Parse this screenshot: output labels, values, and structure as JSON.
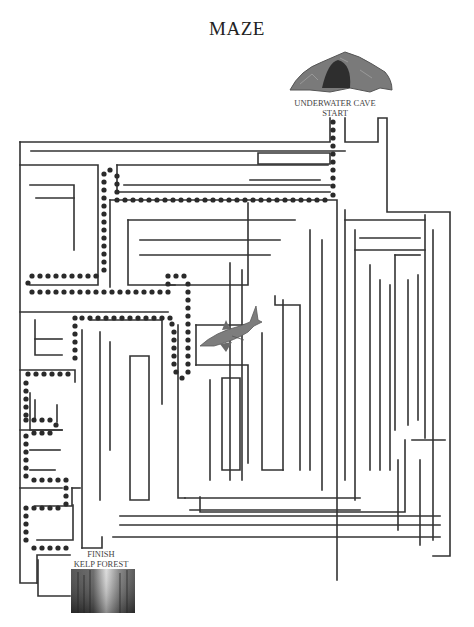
{
  "title": "MAZE",
  "start": {
    "line1": "UNDERWATER CAVE",
    "line2": "START"
  },
  "finish": {
    "line1": "FINISH",
    "line2": "KELP FOREST"
  },
  "colors": {
    "wall": "#333333",
    "dot": "#2a2a2a",
    "shark": "#7a7a7a",
    "cave": "#6b6b6b"
  },
  "walls": [
    "M20 142 H330 V118",
    "M345 118 V142 H378 V118 H387 V212 H450 V556 H433",
    "M20 142 V583 H37",
    "M37 583 V555 H70",
    "M20 165 H98 V285 H30",
    "M30 185 H74 V250",
    "M36 198 H74",
    "M31 151 H345",
    "M117 165 H328",
    "M117 165 V192 H330",
    "M124 185 H330",
    "M258 153 H330 V164 H258 Z",
    "M250 180 H320",
    "M110 200 H337 V580",
    "M110 200 V287",
    "M128 220 H295",
    "M128 220 V285 H175",
    "M140 240 H280",
    "M140 255 H270",
    "M170 285 H248 V203",
    "M20 312 H168",
    "M35 320 V355 H62",
    "M35 339 H62",
    "M20 370 H75 V382",
    "M30 393 V430 H62",
    "M35 400 V420",
    "M57 405 V422",
    "M20 430 H62",
    "M30 450 H60",
    "M30 470 H55",
    "M20 488 H62",
    "M35 506 H72 V488",
    "M72 488 H80",
    "M90 320 H162 V404",
    "M100 332 V500",
    "M110 342 V450",
    "M130 356 H149 V500 H130 Z",
    "M178 325 V498 H185",
    "M196 325 H250",
    "M196 325 V365",
    "M196 365 H248 V463",
    "M210 380 V480",
    "M222 378 H240 V470 H222 Z",
    "M262 333 V470 H283",
    "M283 300 V470",
    "M275 296 V305 H300 V470",
    "M230 263 V480",
    "M242 270 V480",
    "M310 230 V470",
    "M322 240 V490",
    "M345 210 V480",
    "M355 230 V500",
    "M345 220 H425",
    "M355 250 H425",
    "M360 238 H420",
    "M425 215 V438",
    "M412 440 H445",
    "M405 440 V512 H200 V497",
    "M395 255 H420",
    "M395 255 V430",
    "M408 280 V425",
    "M418 275 V420",
    "M433 230 V540",
    "M390 285 V470",
    "M370 265 V470",
    "M380 280 V470",
    "M398 460 V530",
    "M420 460 V545",
    "M185 498 H360",
    "M190 510 H360",
    "M120 516 H440",
    "M120 525 H440",
    "M113 537 H440",
    "M82 330 V548",
    "M82 548 H102 V537",
    "M38 560 V596 H70",
    "M37 540 H73 V505"
  ],
  "solution_dots": [
    [
      333,
      122
    ],
    [
      333,
      130
    ],
    [
      333,
      138
    ],
    [
      333,
      146
    ],
    [
      333,
      154
    ],
    [
      333,
      162
    ],
    [
      333,
      170
    ],
    [
      333,
      178
    ],
    [
      333,
      186
    ],
    [
      333,
      195
    ],
    [
      325,
      200
    ],
    [
      317,
      200
    ],
    [
      309,
      200
    ],
    [
      301,
      200
    ],
    [
      293,
      200
    ],
    [
      285,
      200
    ],
    [
      277,
      200
    ],
    [
      269,
      200
    ],
    [
      261,
      200
    ],
    [
      253,
      200
    ],
    [
      245,
      200
    ],
    [
      237,
      200
    ],
    [
      229,
      200
    ],
    [
      221,
      200
    ],
    [
      213,
      200
    ],
    [
      205,
      200
    ],
    [
      197,
      200
    ],
    [
      189,
      200
    ],
    [
      181,
      200
    ],
    [
      173,
      200
    ],
    [
      165,
      200
    ],
    [
      157,
      200
    ],
    [
      149,
      200
    ],
    [
      141,
      200
    ],
    [
      133,
      200
    ],
    [
      125,
      200
    ],
    [
      117,
      200
    ],
    [
      117,
      192
    ],
    [
      117,
      184
    ],
    [
      117,
      176
    ],
    [
      110,
      170
    ],
    [
      104,
      174
    ],
    [
      104,
      182
    ],
    [
      104,
      190
    ],
    [
      104,
      198
    ],
    [
      104,
      206
    ],
    [
      104,
      214
    ],
    [
      104,
      222
    ],
    [
      104,
      230
    ],
    [
      104,
      238
    ],
    [
      104,
      246
    ],
    [
      104,
      254
    ],
    [
      104,
      262
    ],
    [
      104,
      270
    ],
    [
      96,
      276
    ],
    [
      88,
      276
    ],
    [
      80,
      276
    ],
    [
      72,
      276
    ],
    [
      64,
      276
    ],
    [
      56,
      276
    ],
    [
      48,
      276
    ],
    [
      40,
      276
    ],
    [
      32,
      276
    ],
    [
      28,
      283
    ],
    [
      32,
      292
    ],
    [
      40,
      292
    ],
    [
      48,
      292
    ],
    [
      56,
      292
    ],
    [
      64,
      292
    ],
    [
      72,
      292
    ],
    [
      80,
      292
    ],
    [
      88,
      292
    ],
    [
      96,
      292
    ],
    [
      104,
      292
    ],
    [
      112,
      292
    ],
    [
      120,
      292
    ],
    [
      128,
      292
    ],
    [
      136,
      292
    ],
    [
      144,
      292
    ],
    [
      152,
      292
    ],
    [
      160,
      292
    ],
    [
      168,
      292
    ],
    [
      168,
      284
    ],
    [
      168,
      276
    ],
    [
      176,
      276
    ],
    [
      184,
      276
    ],
    [
      188,
      284
    ],
    [
      188,
      292
    ],
    [
      188,
      300
    ],
    [
      188,
      308
    ],
    [
      188,
      316
    ],
    [
      188,
      324
    ],
    [
      188,
      332
    ],
    [
      188,
      340
    ],
    [
      188,
      348
    ],
    [
      188,
      356
    ],
    [
      188,
      364
    ],
    [
      188,
      372
    ],
    [
      182,
      378
    ],
    [
      176,
      372
    ],
    [
      174,
      364
    ],
    [
      174,
      356
    ],
    [
      174,
      348
    ],
    [
      174,
      340
    ],
    [
      174,
      332
    ],
    [
      172,
      324
    ],
    [
      170,
      318
    ],
    [
      162,
      318
    ],
    [
      154,
      318
    ],
    [
      146,
      318
    ],
    [
      138,
      318
    ],
    [
      130,
      318
    ],
    [
      122,
      318
    ],
    [
      114,
      318
    ],
    [
      106,
      318
    ],
    [
      98,
      318
    ],
    [
      90,
      318
    ],
    [
      82,
      318
    ],
    [
      75,
      318
    ],
    [
      75,
      326
    ],
    [
      75,
      334
    ],
    [
      75,
      342
    ],
    [
      75,
      350
    ],
    [
      75,
      358
    ],
    [
      68,
      374
    ],
    [
      60,
      374
    ],
    [
      52,
      374
    ],
    [
      44,
      374
    ],
    [
      36,
      374
    ],
    [
      28,
      374
    ],
    [
      26,
      383
    ],
    [
      26,
      391
    ],
    [
      26,
      399
    ],
    [
      26,
      407
    ],
    [
      26,
      415
    ],
    [
      26,
      420
    ],
    [
      34,
      420
    ],
    [
      42,
      420
    ],
    [
      50,
      420
    ],
    [
      56,
      425
    ],
    [
      50,
      433
    ],
    [
      42,
      433
    ],
    [
      34,
      433
    ],
    [
      26,
      436
    ],
    [
      26,
      444
    ],
    [
      26,
      452
    ],
    [
      26,
      460
    ],
    [
      26,
      468
    ],
    [
      26,
      476
    ],
    [
      34,
      480
    ],
    [
      42,
      480
    ],
    [
      50,
      480
    ],
    [
      58,
      480
    ],
    [
      66,
      480
    ],
    [
      66,
      488
    ],
    [
      66,
      496
    ],
    [
      66,
      504
    ],
    [
      58,
      508
    ],
    [
      50,
      508
    ],
    [
      42,
      508
    ],
    [
      34,
      508
    ],
    [
      26,
      508
    ],
    [
      26,
      516
    ],
    [
      26,
      524
    ],
    [
      26,
      532
    ],
    [
      26,
      540
    ],
    [
      34,
      548
    ],
    [
      42,
      548
    ],
    [
      50,
      548
    ],
    [
      58,
      548
    ],
    [
      66,
      548
    ]
  ]
}
